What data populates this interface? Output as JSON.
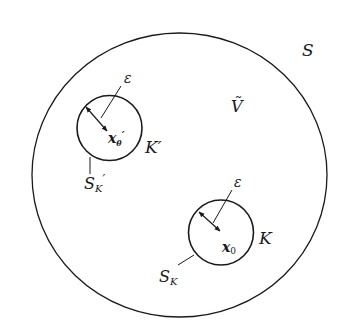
{
  "diagram": {
    "type": "region-with-excluded-balls",
    "colors": {
      "stroke": "#1a1a1a",
      "background": "#ffffff"
    },
    "outer_region": {
      "boundary_label": "S",
      "interior_label": "Ṽ"
    },
    "balls": [
      {
        "id": "K-prime",
        "region_label": "K′",
        "center_label": "x",
        "center_subscript": "θ",
        "center_prime": "′",
        "surface_label": "S",
        "surface_subscript": "K",
        "surface_prime": "′",
        "radius_label": "ε"
      },
      {
        "id": "K",
        "region_label": "K",
        "center_label": "x",
        "center_subscript": "0",
        "surface_label": "S",
        "surface_subscript": "K",
        "radius_label": "ε"
      }
    ]
  }
}
